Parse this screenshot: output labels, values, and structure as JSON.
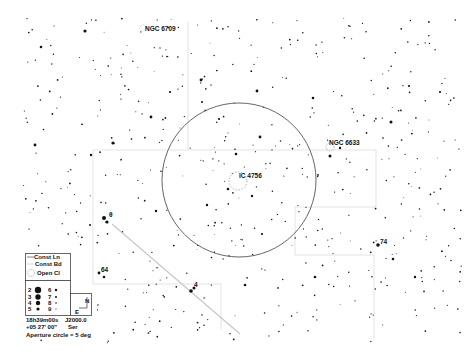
{
  "map": {
    "width": 474,
    "height": 355,
    "background": "#ffffff",
    "boundary_color": "#d8d8d8",
    "circle_color": "#555555",
    "star_color": "#111111",
    "aperture_circle": {
      "cx": 239,
      "cy": 180,
      "r": 77
    },
    "objects": [
      {
        "name": "NGC 6709",
        "type": "open-cluster",
        "label": "NGC 6709",
        "x": 144,
        "y": 29
      },
      {
        "name": "NGC 6633",
        "type": "open-cluster",
        "label": "NGC 6633",
        "x": 328,
        "y": 143
      },
      {
        "name": "IC 4756",
        "type": "open-cluster",
        "label": "IC 4756",
        "x": 239,
        "y": 176
      }
    ],
    "star_labels": [
      {
        "label": "74",
        "x": 379,
        "y": 244
      },
      {
        "label": "64",
        "x": 101,
        "y": 272
      },
      {
        "label": "4",
        "x": 194,
        "y": 286
      },
      {
        "label": "θ",
        "x": 110,
        "y": 215
      }
    ]
  },
  "legend": {
    "const_ln": "Const Ln",
    "const_bd": "Const Bd",
    "open_cl": "Open Cl",
    "magnitudes": [
      {
        "mag": "2",
        "r": 3.2
      },
      {
        "mag": "3",
        "r": 2.7
      },
      {
        "mag": "4",
        "r": 2.2
      },
      {
        "mag": "5",
        "r": 1.6
      },
      {
        "mag": "6",
        "r": 1.2
      },
      {
        "mag": "7",
        "r": 1.0
      },
      {
        "mag": "8",
        "r": 0.8
      },
      {
        "mag": "9",
        "r": 0.6
      }
    ],
    "compass_n": "N",
    "compass_e": "E",
    "ra": "18h39m00s",
    "epoch": "J2000.0",
    "dec": "+05 27' 00\"",
    "constellation": "Ser",
    "aperture": "Aperture circle = 5 deg"
  },
  "chart_data": {
    "type": "scatter",
    "center": {
      "ra": "18h39m00s",
      "dec": "+05 27' 00\"",
      "epoch": "J2000.0"
    },
    "aperture_circle_deg": 5,
    "deep_sky_objects": [
      "NGC 6709",
      "NGC 6633",
      "IC 4756"
    ],
    "labeled_stars": [
      "74",
      "64",
      "4",
      "θ"
    ],
    "magnitude_key": [
      2,
      3,
      4,
      5,
      6,
      7,
      8,
      9
    ]
  }
}
